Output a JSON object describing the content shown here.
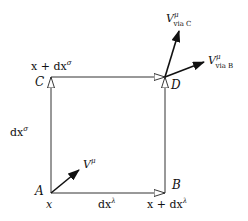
{
  "diagram": {
    "type": "parallel-transport-loop",
    "points": {
      "A": {
        "label": "A",
        "coord": "x"
      },
      "B": {
        "label": "B",
        "coord": "x + dx",
        "coord_sup": "λ"
      },
      "C": {
        "label": "C",
        "coord": "x + dx",
        "coord_sup": "σ"
      },
      "D": {
        "label": "D"
      }
    },
    "edges": {
      "bottom": {
        "label": "dx",
        "sup": "λ"
      },
      "left": {
        "label": "dx",
        "sup": "σ"
      }
    },
    "vectors": {
      "initial": {
        "label": "V",
        "sup": "μ"
      },
      "via_c": {
        "label": "V",
        "sup": "μ",
        "sub": "via C"
      },
      "via_b": {
        "label": "V",
        "sup": "μ",
        "sub": "via B"
      }
    },
    "colors": {
      "line": "#222222",
      "text": "#111111",
      "background": "#ffffff"
    }
  }
}
